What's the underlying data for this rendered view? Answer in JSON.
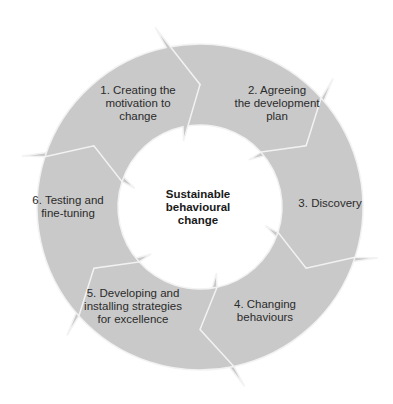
{
  "center": {
    "line1": "Sustainable",
    "line2": "behavioural",
    "line3": "change"
  },
  "steps": [
    {
      "line1": "1. Creating the",
      "line2": "motivation to",
      "line3": "change"
    },
    {
      "line1": "2. Agreeing",
      "line2": "the development",
      "line3": "plan"
    },
    {
      "line1": "3. Discovery",
      "line2": "",
      "line3": ""
    },
    {
      "line1": "4. Changing",
      "line2": "behaviours",
      "line3": ""
    },
    {
      "line1": "5. Developing and",
      "line2": "installing strategies",
      "line3": "for excellence"
    },
    {
      "line1": "6. Testing and",
      "line2": "fine-tuning",
      "line3": ""
    }
  ],
  "colors": {
    "segment_fill": "#c9c9c9",
    "segment_divider": "#f2f2f2",
    "text": "#2b2b2b",
    "background": "#ffffff"
  }
}
